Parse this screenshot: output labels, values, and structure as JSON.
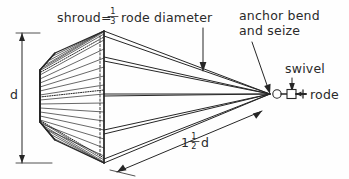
{
  "figure": {
    "type": "technical-line-drawing",
    "background_color": "#fefefe",
    "ink_color": "#262626"
  },
  "labels": {
    "title_prefix": "shroud=",
    "title_fraction_numerator": "1",
    "title_fraction_denominator": "3",
    "title_suffix": "rode diameter",
    "anchor_bend_line1": "anchor bend",
    "anchor_bend_line2": "and seize",
    "swivel": "swivel",
    "rode": "rode",
    "diameter": "d",
    "length_prefix": "1",
    "length_fraction_numerator": "1",
    "length_fraction_denominator": "2",
    "length_suffix": "d"
  },
  "dimensions": {
    "shroud_diameter_label": "d",
    "shroud_length_label": "1 1/2 d",
    "shroud_ratio_label": "1/3 rode diameter"
  },
  "parts": [
    {
      "name": "shroud-cone",
      "description": "tapered hexagonal shroud body"
    },
    {
      "name": "thimble-ring",
      "description": "small ring at apex"
    },
    {
      "name": "swivel",
      "description": "rectangular swivel fitting"
    },
    {
      "name": "rode",
      "description": "anchor line extending right"
    }
  ]
}
